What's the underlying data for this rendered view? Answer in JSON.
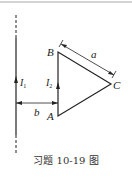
{
  "figure": {
    "caption": "习题 10-19 图",
    "labels": {
      "B": "B",
      "A": "A",
      "C": "C",
      "a": "a",
      "b": "b",
      "I1": "I",
      "I1_sub": "1",
      "I2": "I",
      "I2_sub": "2"
    },
    "colors": {
      "line": "#222222",
      "rule": "#999999"
    }
  }
}
